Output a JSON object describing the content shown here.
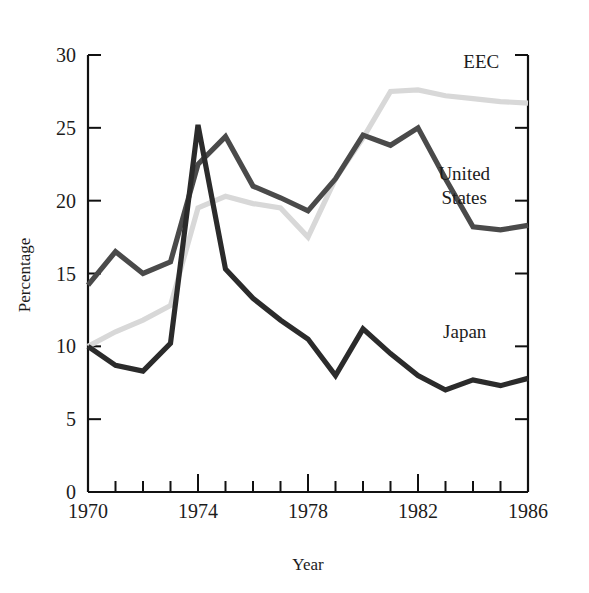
{
  "chart_data": {
    "type": "line",
    "title": "",
    "xlabel": "Year",
    "ylabel": "Percentage",
    "x": [
      1970,
      1971,
      1972,
      1973,
      1974,
      1975,
      1976,
      1977,
      1978,
      1979,
      1980,
      1981,
      1982,
      1983,
      1984,
      1985,
      1986
    ],
    "xlim": [
      1970,
      1986
    ],
    "ylim": [
      0,
      30
    ],
    "xticks": [
      1970,
      1971,
      1972,
      1973,
      1974,
      1975,
      1976,
      1977,
      1978,
      1979,
      1980,
      1981,
      1982,
      1983,
      1984,
      1985,
      1986
    ],
    "xtick_labels": [
      "1970",
      "",
      "",
      "",
      "1974",
      "",
      "",
      "",
      "1978",
      "",
      "",
      "",
      "1982",
      "",
      "",
      "",
      "1986"
    ],
    "yticks": [
      0,
      5,
      10,
      15,
      20,
      25,
      30
    ],
    "ytick_labels": [
      "0",
      "5",
      "10",
      "15",
      "20",
      "25",
      "30"
    ],
    "grid": false,
    "legend_position": "inline-labels",
    "series": [
      {
        "name": "EEC",
        "color": "#d8d8d8",
        "label_x": 1984.3,
        "label_y": 29.1,
        "values": [
          10.0,
          11.0,
          11.8,
          12.8,
          19.5,
          20.3,
          19.8,
          19.5,
          17.5,
          21.5,
          24.3,
          27.5,
          27.6,
          27.2,
          27.0,
          26.8,
          26.7
        ]
      },
      {
        "name": "United States",
        "color": "#4a4a4a",
        "label_x": 1983.9,
        "label_y": 21.4,
        "values": [
          14.2,
          16.5,
          15.0,
          15.8,
          22.5,
          24.4,
          21.0,
          20.2,
          19.3,
          21.5,
          24.5,
          23.8,
          25.0,
          21.5,
          18.2,
          18.0,
          18.3
        ]
      },
      {
        "name": "Japan",
        "color": "#2b2b2b",
        "label_x": 1983.7,
        "label_y": 10.6,
        "values": [
          10.0,
          8.7,
          8.3,
          10.2,
          25.2,
          15.3,
          13.3,
          11.8,
          10.5,
          8.0,
          11.2,
          9.5,
          8.0,
          7.0,
          7.7,
          7.3,
          7.8
        ]
      }
    ]
  },
  "axis": {
    "y_title": "Percentage",
    "x_title": "Year"
  }
}
